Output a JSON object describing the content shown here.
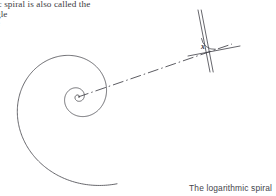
{
  "page": {
    "width": 276,
    "height": 196,
    "background": "#ffffff",
    "ink_color": "#4b4b52"
  },
  "text_block": {
    "line_1": "hmic spiral is also called the",
    "line_2": "gle",
    "line_3": "e"
  },
  "caption": {
    "text": "The logarithmic spiral"
  },
  "figure": {
    "angle_label": "x",
    "spiral": {
      "center_x": 78,
      "center_y": 97,
      "growth_b": 0.24,
      "turns": 2.9,
      "start_radius": 1.2
    },
    "radial_line": {
      "x1": 78,
      "y1": 97,
      "x2": 232,
      "y2": 44,
      "style": "dash-dot"
    },
    "tangent_line": {
      "x1": 198,
      "y1": 10,
      "x2": 210,
      "y2": 72
    },
    "cross_line": {
      "x1": 188,
      "y1": 56,
      "x2": 240,
      "y2": 46
    },
    "angle_arc": {
      "vertex_x": 203,
      "vertex_y": 51,
      "radius": 13
    }
  }
}
